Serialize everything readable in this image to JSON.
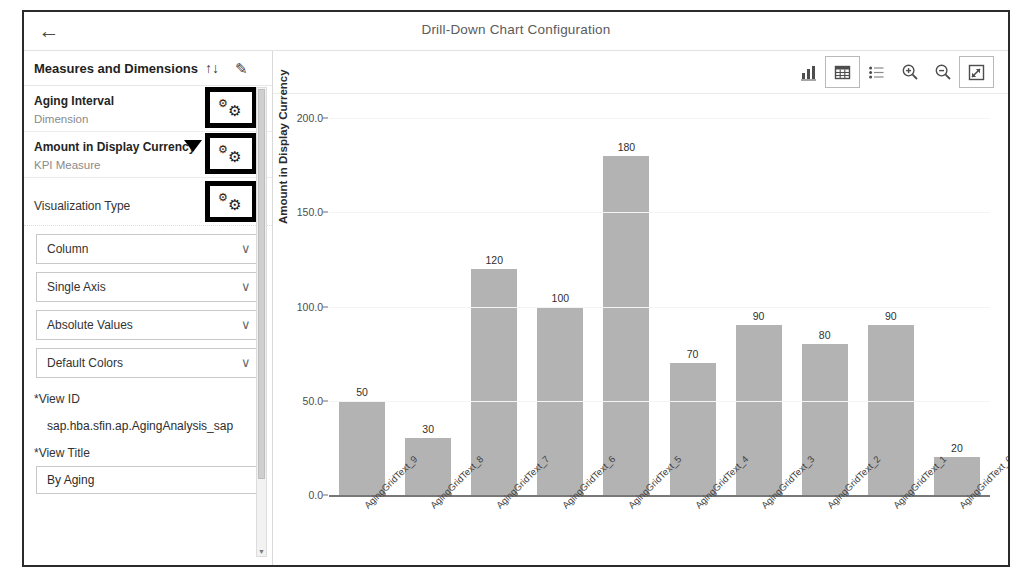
{
  "window": {
    "title": "Drill-Down Chart Configuration",
    "back_icon": "back-arrow-icon"
  },
  "sidebar": {
    "header": {
      "title": "Measures and Dimensions",
      "sort_icon": "↑↓",
      "edit_icon": "✎"
    },
    "rows": [
      {
        "title": "Aging Interval",
        "subtitle": "Dimension",
        "settings_icon": "gear-icon"
      },
      {
        "title": "Amount in Display Currency",
        "subtitle": "KPI Measure",
        "settings_icon": "gear-icon"
      }
    ],
    "visualization": {
      "section_title": "Visualization Type",
      "settings_icon": "gear-icon",
      "selects": [
        {
          "value": "Column",
          "chevron": "∨"
        },
        {
          "value": "Single Axis",
          "chevron": "∨"
        },
        {
          "value": "Absolute Values",
          "chevron": "∨"
        },
        {
          "value": "Default Colors",
          "chevron": "∨"
        }
      ]
    },
    "fields": [
      {
        "label": "*View ID",
        "value": "sap.hba.sfin.ap.AgingAnalysis_sap"
      },
      {
        "label": "*View Title",
        "value": "By Aging"
      }
    ]
  },
  "toolbar": {
    "buttons": [
      {
        "name": "chart-view-icon",
        "label": "Chart View"
      },
      {
        "name": "table-view-icon",
        "label": "Table View"
      },
      {
        "name": "list-view-icon",
        "label": "List View"
      },
      {
        "name": "zoom-in-icon",
        "label": "Zoom In"
      },
      {
        "name": "zoom-out-icon",
        "label": "Zoom Out"
      },
      {
        "name": "fullscreen-icon",
        "label": "Full Screen"
      }
    ]
  },
  "chart_data": {
    "type": "bar",
    "title": "",
    "xlabel": "",
    "ylabel": "Amount in Display Currency",
    "categories": [
      "AgingGridText_9",
      "AgingGridText_8",
      "AgingGridText_7",
      "AgingGridText_6",
      "AgingGridText_5",
      "AgingGridText_4",
      "AgingGridText_3",
      "AgingGridText_2",
      "AgingGridText_1",
      "AgingGridText_0"
    ],
    "values": [
      50,
      30,
      120,
      100,
      180,
      70,
      90,
      80,
      90,
      20
    ],
    "data_labels": [
      "50",
      "30",
      "120",
      "100",
      "180",
      "70",
      "90",
      "80",
      "90",
      "20"
    ],
    "ylim": [
      0,
      200
    ],
    "yticks": [
      0,
      50,
      100,
      150,
      200
    ],
    "ytick_labels": [
      "0.0",
      "50.0",
      "100.0",
      "150.0",
      "200.0"
    ],
    "grid": true,
    "legend": false,
    "bar_color": "#b3b3b3"
  }
}
